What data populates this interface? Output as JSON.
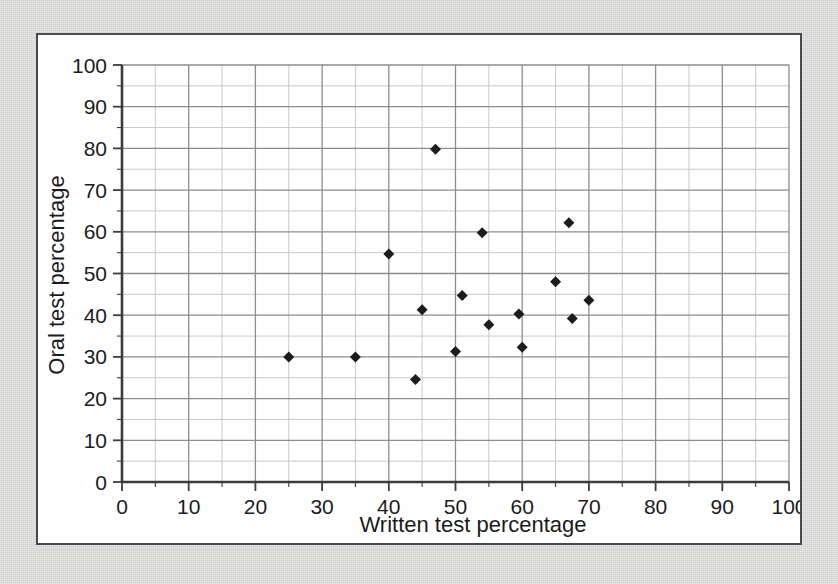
{
  "figure": {
    "background_color": "#d7d7d4",
    "card_background": "#ffffff",
    "card_border_color": "#4a4a4a",
    "marker_color": "#1c1c1c",
    "grid_major_color": "#8d8d8d",
    "grid_minor_color": "#c9c9c9",
    "axis_color": "#3c3c3c"
  },
  "chart_data": {
    "type": "scatter",
    "title": "",
    "xlabel": "Written test percentage",
    "ylabel": "Oral test percentage",
    "xlim": [
      0,
      100
    ],
    "ylim": [
      0,
      100
    ],
    "xticks": [
      0,
      10,
      20,
      30,
      40,
      50,
      60,
      70,
      80,
      90,
      100
    ],
    "yticks": [
      0,
      10,
      20,
      30,
      40,
      50,
      60,
      70,
      80,
      90,
      100
    ],
    "xtick_labels": [
      "0",
      "10",
      "20",
      "30",
      "40",
      "50",
      "60",
      "70",
      "80",
      "90",
      "100"
    ],
    "ytick_labels": [
      "0",
      "10",
      "20",
      "30",
      "40",
      "50",
      "60",
      "70",
      "80",
      "90",
      "100"
    ],
    "minor_tick_step": 5,
    "grid": true,
    "grid_major_step": 10,
    "grid_minor_step": 5,
    "legend": null,
    "legend_position": "none",
    "marker": "diamond",
    "marker_size": 11,
    "n_points": 18,
    "points": [
      {
        "x": 25,
        "y": 30.0
      },
      {
        "x": 35,
        "y": 30.0
      },
      {
        "x": 40,
        "y": 54.7
      },
      {
        "x": 44,
        "y": 24.6
      },
      {
        "x": 45,
        "y": 41.3
      },
      {
        "x": 47,
        "y": 79.8
      },
      {
        "x": 50,
        "y": 31.3
      },
      {
        "x": 51,
        "y": 44.7
      },
      {
        "x": 54,
        "y": 59.8
      },
      {
        "x": 55,
        "y": 37.7
      },
      {
        "x": 59.5,
        "y": 40.3
      },
      {
        "x": 60,
        "y": 32.3
      },
      {
        "x": 65,
        "y": 48.0
      },
      {
        "x": 67,
        "y": 62.2
      },
      {
        "x": 67.5,
        "y": 39.2
      },
      {
        "x": 70,
        "y": 43.6
      }
    ],
    "x": [
      25,
      35,
      40,
      44,
      45,
      47,
      50,
      51,
      54,
      55,
      59.5,
      60,
      65,
      67,
      67.5,
      70
    ],
    "y": [
      30.0,
      30.0,
      54.7,
      24.6,
      41.3,
      79.8,
      31.3,
      44.7,
      59.8,
      37.7,
      40.3,
      32.3,
      48.0,
      62.2,
      39.2,
      43.6
    ]
  }
}
